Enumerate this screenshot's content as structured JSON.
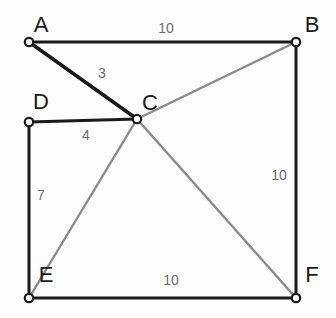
{
  "figure": {
    "background_color": "#fdfdfd",
    "width": 336,
    "height": 318
  },
  "style": {
    "edge_dark_color": "#1a1a1a",
    "edge_light_color": "#8a8a8a",
    "node_stroke_color": "#1a1a1a",
    "node_fill_color": "#ffffff",
    "label_color": "#1a1a1a",
    "weight_color": "#6b6b6b"
  },
  "chart_data": {
    "type": "diagram",
    "subtype": "weighted-graph",
    "title": "",
    "nodes": [
      {
        "id": "A",
        "label": "A",
        "x": 29,
        "y": 42,
        "label_x": 41,
        "label_y": 26
      },
      {
        "id": "B",
        "label": "B",
        "x": 296,
        "y": 42,
        "label_x": 312,
        "label_y": 26
      },
      {
        "id": "C",
        "label": "C",
        "x": 137,
        "y": 119,
        "label_x": 150,
        "label_y": 104
      },
      {
        "id": "D",
        "label": "D",
        "x": 29,
        "y": 122,
        "label_x": 41,
        "label_y": 103
      },
      {
        "id": "E",
        "label": "E",
        "x": 29,
        "y": 298,
        "label_x": 46,
        "label_y": 276
      },
      {
        "id": "F",
        "label": "F",
        "x": 296,
        "y": 298,
        "label_x": 312,
        "label_y": 276
      }
    ],
    "edges": [
      {
        "from": "A",
        "to": "B",
        "weight": "10",
        "tone": "dark",
        "label_x": 166,
        "label_y": 29
      },
      {
        "from": "A",
        "to": "C",
        "weight": "3",
        "tone": "dark",
        "label_x": 102,
        "label_y": 74
      },
      {
        "from": "D",
        "to": "C",
        "weight": "4",
        "tone": "dark",
        "label_x": 86,
        "label_y": 136
      },
      {
        "from": "D",
        "to": "E",
        "weight": "7",
        "tone": "dark",
        "label_x": 41,
        "label_y": 196
      },
      {
        "from": "E",
        "to": "F",
        "weight": "10",
        "tone": "dark",
        "label_x": 171,
        "label_y": 281
      },
      {
        "from": "B",
        "to": "F",
        "weight": "10",
        "tone": "dark",
        "label_x": 279,
        "label_y": 176
      },
      {
        "from": "C",
        "to": "B",
        "weight": "",
        "tone": "light",
        "label_x": 0,
        "label_y": 0
      },
      {
        "from": "C",
        "to": "E",
        "weight": "",
        "tone": "light",
        "label_x": 0,
        "label_y": 0
      },
      {
        "from": "C",
        "to": "F",
        "weight": "",
        "tone": "light",
        "label_x": 0,
        "label_y": 0
      }
    ],
    "weight_labels": [
      "10",
      "3",
      "4",
      "7",
      "10",
      "10"
    ],
    "node_labels": [
      "A",
      "B",
      "C",
      "D",
      "E",
      "F"
    ]
  }
}
